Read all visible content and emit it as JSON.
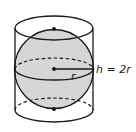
{
  "figure": {
    "colors": {
      "stroke": "#1a1a1a",
      "sphere_fill": "#d6d6d6",
      "background": "#ffffff"
    },
    "labels": {
      "radius": "r",
      "height": "h = 2r"
    },
    "shapes": {
      "cylinder": {
        "cx": 54,
        "top_cy": 28,
        "bottom_cy": 110,
        "rx": 39,
        "ry": 12
      },
      "sphere": {
        "cx": 54,
        "cy": 69,
        "r": 40
      },
      "points": [
        "top-pole",
        "center",
        "bottom-pole"
      ]
    }
  }
}
